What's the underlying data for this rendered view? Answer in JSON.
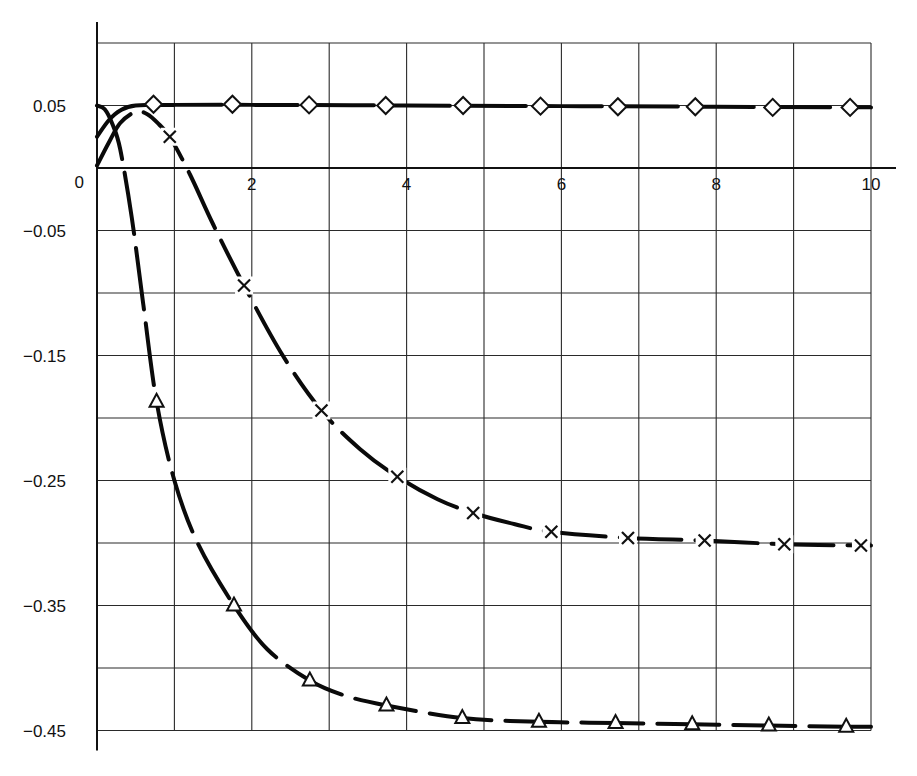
{
  "chart_data": {
    "type": "line",
    "title": "",
    "xlabel": "",
    "ylabel": "",
    "xlim": [
      0,
      10
    ],
    "ylim": [
      -0.45,
      0.1
    ],
    "grid": true,
    "legend": null,
    "x_ticks": [
      0,
      1,
      2,
      3,
      4,
      5,
      6,
      7,
      8,
      9,
      10
    ],
    "x_tick_labels": [
      {
        "value": 2,
        "label": "2"
      },
      {
        "value": 4,
        "label": "4"
      },
      {
        "value": 6,
        "label": "6"
      },
      {
        "value": 8,
        "label": "8"
      },
      {
        "value": 10,
        "label": "10"
      }
    ],
    "y_ticks": [
      0.1,
      0.05,
      0,
      -0.05,
      -0.1,
      -0.15,
      -0.2,
      -0.25,
      -0.3,
      -0.35,
      -0.4,
      -0.45
    ],
    "y_tick_labels": [
      {
        "value": 0.05,
        "label": "0.05"
      },
      {
        "value": 0,
        "label": "0"
      },
      {
        "value": -0.05,
        "label": "−0.05"
      },
      {
        "value": -0.15,
        "label": "−0.15"
      },
      {
        "value": -0.25,
        "label": "−0.25"
      },
      {
        "value": -0.35,
        "label": "−0.35"
      },
      {
        "value": -0.45,
        "label": "−0.45"
      }
    ],
    "series": [
      {
        "name": "diamond",
        "marker": "diamond",
        "curve": [
          [
            0,
            0.025
          ],
          [
            0.15,
            0.038
          ],
          [
            0.3,
            0.046
          ],
          [
            0.5,
            0.05
          ],
          [
            1,
            0.0505
          ],
          [
            2,
            0.0505
          ],
          [
            4,
            0.05
          ],
          [
            6,
            0.0495
          ],
          [
            8,
            0.049
          ],
          [
            10,
            0.0485
          ]
        ],
        "markers": [
          [
            0.73,
            0.051
          ],
          [
            1.75,
            0.051
          ],
          [
            2.74,
            0.0505
          ],
          [
            3.73,
            0.05
          ],
          [
            4.73,
            0.05
          ],
          [
            5.73,
            0.0495
          ],
          [
            6.73,
            0.049
          ],
          [
            7.73,
            0.049
          ],
          [
            8.73,
            0.0485
          ],
          [
            9.73,
            0.0485
          ]
        ]
      },
      {
        "name": "cross",
        "marker": "x",
        "curve": [
          [
            0,
            0.002
          ],
          [
            0.15,
            0.02
          ],
          [
            0.3,
            0.036
          ],
          [
            0.5,
            0.045
          ],
          [
            0.65,
            0.043
          ],
          [
            0.8,
            0.035
          ],
          [
            0.94,
            0.025
          ],
          [
            1.2,
            -0.005
          ],
          [
            1.5,
            -0.045
          ],
          [
            1.9,
            -0.094
          ],
          [
            2.4,
            -0.15
          ],
          [
            2.9,
            -0.194
          ],
          [
            3.4,
            -0.225
          ],
          [
            3.88,
            -0.247
          ],
          [
            4.4,
            -0.265
          ],
          [
            4.86,
            -0.276
          ],
          [
            5.4,
            -0.285
          ],
          [
            5.87,
            -0.291
          ],
          [
            6.86,
            -0.296
          ],
          [
            7.85,
            -0.298
          ],
          [
            8.88,
            -0.301
          ],
          [
            9.87,
            -0.302
          ],
          [
            10,
            -0.302
          ]
        ],
        "markers": [
          [
            0.94,
            0.025
          ],
          [
            1.9,
            -0.094
          ],
          [
            2.9,
            -0.194
          ],
          [
            3.88,
            -0.247
          ],
          [
            4.86,
            -0.276
          ],
          [
            5.87,
            -0.291
          ],
          [
            6.86,
            -0.296
          ],
          [
            7.85,
            -0.298
          ],
          [
            8.88,
            -0.301
          ],
          [
            9.87,
            -0.302
          ]
        ]
      },
      {
        "name": "triangle",
        "marker": "triangle",
        "curve": [
          [
            0,
            0.05
          ],
          [
            0.1,
            0.047
          ],
          [
            0.2,
            0.035
          ],
          [
            0.3,
            0.015
          ],
          [
            0.45,
            -0.04
          ],
          [
            0.6,
            -0.11
          ],
          [
            0.77,
            -0.187
          ],
          [
            1.0,
            -0.25
          ],
          [
            1.3,
            -0.3
          ],
          [
            1.77,
            -0.35
          ],
          [
            2.2,
            -0.385
          ],
          [
            2.75,
            -0.41
          ],
          [
            3.2,
            -0.422
          ],
          [
            3.74,
            -0.43
          ],
          [
            4.72,
            -0.44
          ],
          [
            5.71,
            -0.443
          ],
          [
            6.7,
            -0.444
          ],
          [
            7.69,
            -0.445
          ],
          [
            8.68,
            -0.446
          ],
          [
            9.68,
            -0.447
          ],
          [
            10,
            -0.447
          ]
        ],
        "markers": [
          [
            0.77,
            -0.187
          ],
          [
            1.77,
            -0.35
          ],
          [
            2.75,
            -0.41
          ],
          [
            3.74,
            -0.43
          ],
          [
            4.72,
            -0.44
          ],
          [
            5.71,
            -0.443
          ],
          [
            6.7,
            -0.444
          ],
          [
            7.69,
            -0.445
          ],
          [
            8.68,
            -0.446
          ],
          [
            9.68,
            -0.447
          ]
        ]
      }
    ]
  }
}
